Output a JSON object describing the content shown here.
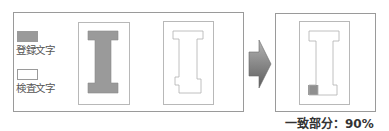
{
  "legend": {
    "registered_label": "登録文字",
    "inspected_label": "検査文字",
    "registered_color": "#9a9a9a",
    "inspected_color": "#ffffff"
  },
  "panels": [
    {
      "name": "registered-character",
      "glyph": "I",
      "fill": "#9a9a9a"
    },
    {
      "name": "inspected-character",
      "glyph": "I",
      "fill": "#ffffff"
    },
    {
      "name": "overlap-result",
      "glyph": "I",
      "fill": "#ffffff",
      "mismatch_fill": "#8f8f8f"
    }
  ],
  "arrow": {
    "icon": "right-arrow-icon",
    "color": "#7a7a7a"
  },
  "result": {
    "caption": "一致部分：90%",
    "match_percent": 90
  }
}
